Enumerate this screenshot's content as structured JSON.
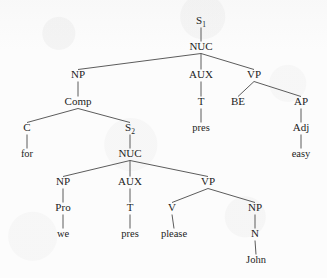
{
  "figure": {
    "kind": "syntax-tree",
    "sentence": "for we pres please John BE easy",
    "background_color": "#fcfcfc",
    "ink_color": "#1c1c1c",
    "edge_color": "#4a4a4a",
    "width": 327,
    "height": 278
  },
  "nodes": [
    {
      "id": "s1",
      "label": "S",
      "sub": "1",
      "x": 201,
      "y": 24,
      "type": "category"
    },
    {
      "id": "nuc1",
      "label": "NUC",
      "sub": "",
      "x": 201,
      "y": 50,
      "type": "category"
    },
    {
      "id": "np1",
      "label": "NP",
      "sub": "",
      "x": 78,
      "y": 78,
      "type": "category"
    },
    {
      "id": "aux1",
      "label": "AUX",
      "sub": "",
      "x": 201,
      "y": 78,
      "type": "category"
    },
    {
      "id": "vp1",
      "label": "VP",
      "sub": "",
      "x": 254,
      "y": 78,
      "type": "category"
    },
    {
      "id": "comp",
      "label": "Comp",
      "sub": "",
      "x": 78,
      "y": 105,
      "type": "category"
    },
    {
      "id": "t1",
      "label": "T",
      "sub": "",
      "x": 201,
      "y": 105,
      "type": "category"
    },
    {
      "id": "be",
      "label": "BE",
      "sub": "",
      "x": 238,
      "y": 105,
      "type": "category"
    },
    {
      "id": "ap",
      "label": "AP",
      "sub": "",
      "x": 301,
      "y": 105,
      "type": "category"
    },
    {
      "id": "c",
      "label": "C",
      "sub": "",
      "x": 27,
      "y": 131,
      "type": "category"
    },
    {
      "id": "s2",
      "label": "S",
      "sub": "2",
      "x": 130,
      "y": 131,
      "type": "category"
    },
    {
      "id": "pres1",
      "label": "pres",
      "sub": "",
      "x": 201,
      "y": 131,
      "type": "terminal"
    },
    {
      "id": "adj",
      "label": "Adj",
      "sub": "",
      "x": 301,
      "y": 131,
      "type": "category"
    },
    {
      "id": "for",
      "label": "for",
      "sub": "",
      "x": 27,
      "y": 157,
      "type": "terminal"
    },
    {
      "id": "nuc2",
      "label": "NUC",
      "sub": "",
      "x": 130,
      "y": 157,
      "type": "category"
    },
    {
      "id": "easy",
      "label": "easy",
      "sub": "",
      "x": 301,
      "y": 157,
      "type": "terminal"
    },
    {
      "id": "np2",
      "label": "NP",
      "sub": "",
      "x": 63,
      "y": 185,
      "type": "category"
    },
    {
      "id": "aux2",
      "label": "AUX",
      "sub": "",
      "x": 130,
      "y": 185,
      "type": "category"
    },
    {
      "id": "vp2",
      "label": "VP",
      "sub": "",
      "x": 208,
      "y": 185,
      "type": "category"
    },
    {
      "id": "pro",
      "label": "Pro",
      "sub": "",
      "x": 63,
      "y": 211,
      "type": "category"
    },
    {
      "id": "t2",
      "label": "T",
      "sub": "",
      "x": 130,
      "y": 211,
      "type": "category"
    },
    {
      "id": "v",
      "label": "V",
      "sub": "",
      "x": 172,
      "y": 211,
      "type": "category"
    },
    {
      "id": "np3",
      "label": "NP",
      "sub": "",
      "x": 255,
      "y": 211,
      "type": "category"
    },
    {
      "id": "we",
      "label": "we",
      "sub": "",
      "x": 63,
      "y": 237,
      "type": "terminal"
    },
    {
      "id": "pres2",
      "label": "pres",
      "sub": "",
      "x": 130,
      "y": 237,
      "type": "terminal"
    },
    {
      "id": "please",
      "label": "please",
      "sub": "",
      "x": 174,
      "y": 237,
      "type": "terminal"
    },
    {
      "id": "n",
      "label": "N",
      "sub": "",
      "x": 255,
      "y": 237,
      "type": "category"
    },
    {
      "id": "john",
      "label": "John",
      "sub": "",
      "x": 256,
      "y": 263,
      "type": "terminal"
    }
  ],
  "edges": [
    {
      "from": "s1",
      "to": "nuc1"
    },
    {
      "from": "nuc1",
      "to": "np1"
    },
    {
      "from": "nuc1",
      "to": "aux1"
    },
    {
      "from": "nuc1",
      "to": "vp1"
    },
    {
      "from": "np1",
      "to": "comp"
    },
    {
      "from": "aux1",
      "to": "t1"
    },
    {
      "from": "vp1",
      "to": "be"
    },
    {
      "from": "vp1",
      "to": "ap"
    },
    {
      "from": "comp",
      "to": "c"
    },
    {
      "from": "comp",
      "to": "s2"
    },
    {
      "from": "t1",
      "to": "pres1"
    },
    {
      "from": "ap",
      "to": "adj"
    },
    {
      "from": "c",
      "to": "for"
    },
    {
      "from": "s2",
      "to": "nuc2"
    },
    {
      "from": "adj",
      "to": "easy"
    },
    {
      "from": "nuc2",
      "to": "np2"
    },
    {
      "from": "nuc2",
      "to": "aux2"
    },
    {
      "from": "nuc2",
      "to": "vp2"
    },
    {
      "from": "np2",
      "to": "pro"
    },
    {
      "from": "aux2",
      "to": "t2"
    },
    {
      "from": "vp2",
      "to": "v"
    },
    {
      "from": "vp2",
      "to": "np3"
    },
    {
      "from": "pro",
      "to": "we"
    },
    {
      "from": "t2",
      "to": "pres2"
    },
    {
      "from": "v",
      "to": "please"
    },
    {
      "from": "np3",
      "to": "n"
    },
    {
      "from": "n",
      "to": "john"
    }
  ]
}
